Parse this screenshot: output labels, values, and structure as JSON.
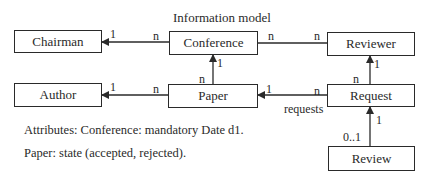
{
  "title": "Information model",
  "entities": {
    "chairman": "Chairman",
    "conference": "Conference",
    "reviewer": "Reviewer",
    "author": "Author",
    "paper": "Paper",
    "request": "Request",
    "review": "Review"
  },
  "relations": [
    {
      "from": "Conference",
      "to": "Chairman",
      "from_mult": "n",
      "to_mult": "1",
      "arrow": true
    },
    {
      "from": "Conference",
      "to": "Reviewer",
      "from_mult": "n",
      "to_mult": "n",
      "arrow": false
    },
    {
      "from": "Paper",
      "to": "Conference",
      "from_mult": "n",
      "to_mult": "1",
      "arrow": true
    },
    {
      "from": "Paper",
      "to": "Author",
      "from_mult": "n",
      "to_mult": "1",
      "arrow": true
    },
    {
      "from": "Request",
      "to": "Reviewer",
      "from_mult": "n",
      "to_mult": "1",
      "arrow": true
    },
    {
      "from": "Request",
      "to": "Paper",
      "from_mult": "n",
      "to_mult": "1",
      "arrow": true,
      "role": "requests"
    },
    {
      "from": "Review",
      "to": "Request",
      "from_mult": "0..1",
      "to_mult": "1",
      "arrow": true
    }
  ],
  "labels": {
    "conf_chair_to": "1",
    "conf_chair_from": "n",
    "conf_rev_left": "n",
    "conf_rev_right": "n",
    "paper_conf_to": "1",
    "paper_conf_from": "n",
    "paper_author_to": "1",
    "paper_author_from": "n",
    "req_rev_to": "1",
    "req_rev_from": "n",
    "req_paper_to": "1",
    "req_paper_from": "n",
    "req_paper_role": "requests",
    "review_req_to": "1",
    "review_req_from": "0..1"
  },
  "notes": {
    "line1": "Attributes: Conference: mandatory Date d1.",
    "line2": "Paper: state (accepted, rejected)."
  }
}
